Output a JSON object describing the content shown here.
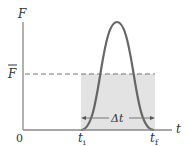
{
  "diagram": {
    "axes": {
      "y_label": "F",
      "x_label": "t",
      "origin_label": "0"
    },
    "average_force_label": "F",
    "average_force_has_bar": true,
    "time_labels": {
      "initial": "t",
      "initial_sub": "i",
      "final": "t",
      "final_sub": "f"
    },
    "interval_label": "Δt",
    "colors": {
      "axis": "#888888",
      "curve": "#666666",
      "shade": "#e3e3e3",
      "dashed": "#777777",
      "text": "#333333"
    }
  }
}
